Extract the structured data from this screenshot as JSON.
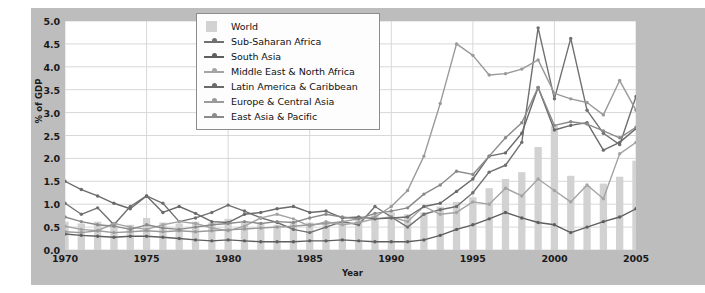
{
  "chart_data": {
    "type": "line",
    "title": "",
    "xlabel": "Year",
    "ylabel": "% of GDP",
    "xlim": [
      1970,
      2005
    ],
    "ylim": [
      0.0,
      5.0
    ],
    "grid": true,
    "legend_position": "top-center",
    "xticks": [
      1970,
      1975,
      1980,
      1985,
      1990,
      1995,
      2000,
      2005
    ],
    "yticks": [
      "0.0",
      "0.5",
      "1.0",
      "1.5",
      "2.0",
      "2.5",
      "3.0",
      "3.5",
      "4.0",
      "4.5",
      "5.0"
    ],
    "x": [
      1970,
      1971,
      1972,
      1973,
      1974,
      1975,
      1976,
      1977,
      1978,
      1979,
      1980,
      1981,
      1982,
      1983,
      1984,
      1985,
      1986,
      1987,
      1988,
      1989,
      1990,
      1991,
      1992,
      1993,
      1994,
      1995,
      1996,
      1997,
      1998,
      1999,
      2000,
      2001,
      2002,
      2003,
      2004,
      2005
    ],
    "bar_series": {
      "name": "World",
      "type": "bar",
      "color": "#d2d2d2",
      "values": [
        0.62,
        0.58,
        0.62,
        0.6,
        0.55,
        0.7,
        0.6,
        0.58,
        0.62,
        0.6,
        0.68,
        0.62,
        0.58,
        0.55,
        0.62,
        0.6,
        0.58,
        0.62,
        0.72,
        0.78,
        0.82,
        0.78,
        0.82,
        0.95,
        1.05,
        1.15,
        1.35,
        1.55,
        1.7,
        2.25,
        2.72,
        1.62,
        1.4,
        1.45,
        1.6,
        1.95
      ]
    },
    "series": [
      {
        "name": "Sub-Saharan Africa",
        "color": "#707070",
        "values": [
          1.02,
          0.78,
          0.92,
          0.55,
          0.95,
          1.18,
          1.02,
          0.62,
          0.7,
          0.82,
          0.98,
          0.85,
          0.7,
          0.6,
          0.45,
          0.38,
          0.5,
          0.62,
          0.55,
          0.95,
          0.72,
          0.5,
          0.78,
          0.88,
          0.95,
          1.25,
          1.7,
          1.85,
          2.35,
          4.85,
          3.3,
          4.62,
          3.05,
          2.55,
          2.3,
          3.35
        ]
      },
      {
        "name": "South Asia",
        "color": "#5e5e5e",
        "values": [
          0.35,
          0.32,
          0.3,
          0.28,
          0.3,
          0.3,
          0.28,
          0.25,
          0.22,
          0.2,
          0.22,
          0.2,
          0.18,
          0.18,
          0.18,
          0.2,
          0.2,
          0.22,
          0.2,
          0.18,
          0.18,
          0.18,
          0.22,
          0.32,
          0.45,
          0.55,
          0.68,
          0.82,
          0.7,
          0.6,
          0.55,
          0.38,
          0.5,
          0.62,
          0.72,
          0.9
        ]
      },
      {
        "name": "Middle East & North Africa",
        "color": "#a4a4a4",
        "values": [
          0.52,
          0.45,
          0.42,
          0.58,
          0.5,
          0.45,
          0.55,
          0.62,
          0.58,
          0.48,
          0.42,
          0.52,
          0.7,
          0.78,
          0.68,
          0.52,
          0.62,
          0.55,
          0.6,
          0.68,
          0.72,
          0.62,
          0.95,
          0.78,
          0.82,
          1.05,
          1.0,
          1.35,
          1.18,
          1.55,
          1.3,
          1.05,
          1.42,
          1.12,
          2.1,
          2.35
        ]
      },
      {
        "name": "Latin America & Caribbean",
        "color": "#6a6a6a",
        "values": [
          1.5,
          1.32,
          1.18,
          1.02,
          0.9,
          1.18,
          0.82,
          0.95,
          0.8,
          0.62,
          0.6,
          0.78,
          0.82,
          0.9,
          0.95,
          0.82,
          0.85,
          0.7,
          0.72,
          0.68,
          0.7,
          0.72,
          0.95,
          1.02,
          1.28,
          1.55,
          2.05,
          2.12,
          2.55,
          3.55,
          2.62,
          2.72,
          2.78,
          2.18,
          2.35,
          2.65
        ]
      },
      {
        "name": "Europe & Central Asia",
        "color": "#9a9a9a",
        "values": [
          0.4,
          0.38,
          0.42,
          0.38,
          0.4,
          0.42,
          0.4,
          0.42,
          0.4,
          0.42,
          0.44,
          0.46,
          0.48,
          0.5,
          0.52,
          0.55,
          0.58,
          0.62,
          0.68,
          0.72,
          0.95,
          1.3,
          2.05,
          3.2,
          4.5,
          4.25,
          3.82,
          3.85,
          3.95,
          4.15,
          3.42,
          3.3,
          3.22,
          2.95,
          3.7,
          3.05
        ]
      },
      {
        "name": "East Asia & Pacific",
        "color": "#8a8a8a",
        "values": [
          0.72,
          0.62,
          0.55,
          0.52,
          0.45,
          0.55,
          0.48,
          0.45,
          0.5,
          0.55,
          0.58,
          0.62,
          0.58,
          0.62,
          0.6,
          0.7,
          0.78,
          0.72,
          0.68,
          0.8,
          0.85,
          0.92,
          1.22,
          1.42,
          1.72,
          1.65,
          2.05,
          2.45,
          2.78,
          3.55,
          2.72,
          2.8,
          2.75,
          2.6,
          2.45,
          2.68
        ]
      }
    ]
  },
  "axes": {
    "ylabel": "% of GDP",
    "xlabel": "Year"
  },
  "legend": {
    "entries": [
      {
        "label": "World",
        "marker": "swatch"
      },
      {
        "label": "Sub-Saharan Africa",
        "marker": "line"
      },
      {
        "label": "South Asia",
        "marker": "line"
      },
      {
        "label": "Middle East & North Africa",
        "marker": "line"
      },
      {
        "label": "Latin America & Caribbean",
        "marker": "line"
      },
      {
        "label": "Europe & Central Asia",
        "marker": "line"
      },
      {
        "label": "East Asia & Pacific",
        "marker": "line"
      }
    ]
  },
  "colors": {
    "panel_background": "#bdbdbd",
    "plot_background": "#ffffff",
    "grid": "#d8d8d8",
    "bar": "#d2d2d2",
    "text": "#1a1a1a"
  }
}
